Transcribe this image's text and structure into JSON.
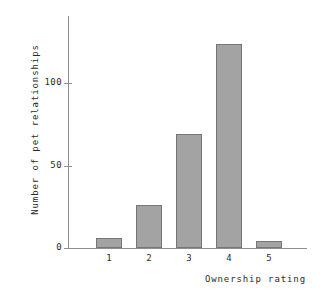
{
  "chart_data": {
    "type": "bar",
    "title": "",
    "subtitle": "",
    "xlabel": "Ownership rating",
    "ylabel": "Number of pet relationships",
    "categories": [
      "1",
      "2",
      "3",
      "4",
      "5"
    ],
    "values": [
      6,
      26,
      69,
      123,
      4
    ],
    "series": [
      {
        "name": "Number of pet relationships",
        "values": [
          6,
          26,
          69,
          123,
          4
        ]
      }
    ],
    "ylim": [
      0,
      140
    ],
    "yticks": [
      0,
      50,
      100
    ],
    "ytick_labels": [
      "0",
      "50",
      "100"
    ],
    "xtick_labels": [
      "1",
      "2",
      "3",
      "4",
      "5"
    ],
    "grid": false,
    "legend": false,
    "legend_position": "none",
    "annotations": [],
    "bar_fill_color": "#a3a3a3",
    "bar_edge_color": "#767676",
    "axis_color": "#8f8f8f",
    "text_color": "#2b2b2b",
    "background_color": "#ffffff"
  }
}
